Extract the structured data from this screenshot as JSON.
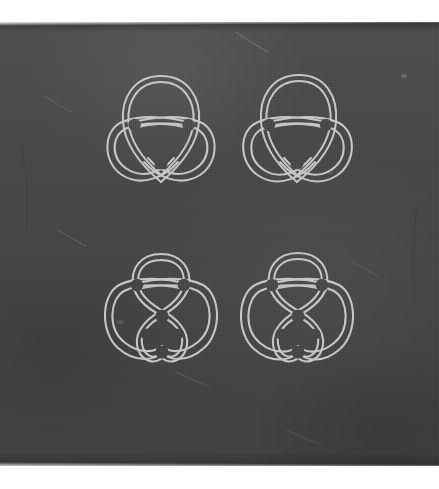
{
  "image": {
    "kind": "photograph-of-engraved-slate-tablet",
    "canvas": {
      "width": 439,
      "height": 489
    },
    "background_color": "#ffffff",
    "caption": ""
  },
  "tablet": {
    "name": "slate-tablet",
    "x": 0,
    "y": 22,
    "width": 439,
    "height": 444,
    "surface_color": "#464646",
    "highlight_color": "#545454",
    "shadow_color": "#3b3b3b",
    "texture": "vertical-fiber-weave",
    "surface_marks": [
      {
        "name": "scratch-top-center",
        "x1": 236,
        "y1": 32,
        "x2": 268,
        "y2": 52,
        "opacity": 0.16
      },
      {
        "name": "scratch-upper-left",
        "x1": 44,
        "y1": 96,
        "x2": 72,
        "y2": 112,
        "opacity": 0.1
      },
      {
        "name": "scratch-mid-left",
        "x1": 58,
        "y1": 230,
        "x2": 86,
        "y2": 246,
        "opacity": 0.12
      },
      {
        "name": "scratch-mid-right",
        "x1": 352,
        "y1": 262,
        "x2": 378,
        "y2": 276,
        "opacity": 0.1
      },
      {
        "name": "scratch-lower-center",
        "x1": 176,
        "y1": 372,
        "x2": 208,
        "y2": 386,
        "opacity": 0.12
      },
      {
        "name": "scratch-bottom-right",
        "x1": 286,
        "y1": 430,
        "x2": 320,
        "y2": 444,
        "opacity": 0.1
      },
      {
        "name": "speck-upper-right",
        "x1": 402,
        "y1": 74,
        "x2": 408,
        "y2": 78,
        "opacity": 0.18
      }
    ]
  },
  "figures": {
    "layout": "2x2-grid",
    "count": 4,
    "stroke_color": "#c6c6c6",
    "stroke_width": 2.05,
    "style": "double-line-parallel-strand",
    "items": [
      {
        "name": "knot-top-left",
        "label": "trefoil-knot",
        "position": {
          "x": 100,
          "y": 70
        },
        "size": {
          "width": 122,
          "height": 128
        },
        "lobes": 3,
        "crossings": 3,
        "orientation": "upright"
      },
      {
        "name": "knot-top-right",
        "label": "trefoil-knot-variant",
        "position": {
          "x": 236,
          "y": 70
        },
        "size": {
          "width": 122,
          "height": 128
        },
        "lobes": 3,
        "crossings": 3,
        "orientation": "upright"
      },
      {
        "name": "knot-bottom-left",
        "label": "figure-eight-knot",
        "position": {
          "x": 100,
          "y": 246
        },
        "size": {
          "width": 122,
          "height": 128
        },
        "lobes": 3,
        "crossings": 4,
        "orientation": "upright"
      },
      {
        "name": "knot-bottom-right",
        "label": "figure-eight-knot-variant",
        "position": {
          "x": 236,
          "y": 246
        },
        "size": {
          "width": 122,
          "height": 128
        },
        "lobes": 3,
        "crossings": 4,
        "orientation": "upright"
      }
    ]
  }
}
